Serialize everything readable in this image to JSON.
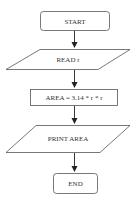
{
  "flowchart": {
    "nodes": [
      {
        "id": "start",
        "type": "terminator",
        "label": "START"
      },
      {
        "id": "read",
        "type": "io",
        "label": "READ r"
      },
      {
        "id": "compute",
        "type": "process",
        "label": "AREA = 3.14 * r * r"
      },
      {
        "id": "print",
        "type": "io",
        "label": "PRINT AREA"
      },
      {
        "id": "end",
        "type": "terminator",
        "label": "END"
      }
    ],
    "edges": [
      {
        "from": "start",
        "to": "read"
      },
      {
        "from": "read",
        "to": "compute"
      },
      {
        "from": "compute",
        "to": "print"
      },
      {
        "from": "print",
        "to": "end"
      }
    ]
  },
  "colors": {
    "stroke": "#555555",
    "text": "#333333",
    "arrow": "#222222"
  }
}
